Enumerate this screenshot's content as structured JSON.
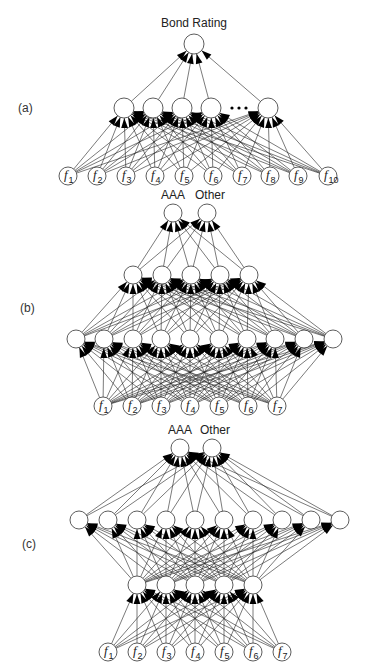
{
  "figure": {
    "panels": [
      {
        "id": "a",
        "label": "(a)",
        "label_pos": [
          18,
          112
        ],
        "output_labels": [
          "Bond Rating"
        ],
        "output_label_pos": [
          [
            194,
            27
          ]
        ],
        "layers": [
          {
            "name": "output",
            "y": 44,
            "r": 10,
            "x": [
              194
            ]
          },
          {
            "name": "hidden",
            "y": 108,
            "r": 10,
            "x": [
              124,
              153,
              182,
              211,
              268
            ],
            "ellipsis_x": [
              232,
              239,
              246
            ]
          },
          {
            "name": "input",
            "y": 176,
            "r": 9,
            "x": [
              68,
              97,
              126,
              155,
              184,
              213,
              242,
              270,
              298,
              328
            ],
            "labels": [
              "f1",
              "f2",
              "f3",
              "f4",
              "f5",
              "f6",
              "f7",
              "f8",
              "f9",
              "f10"
            ]
          }
        ]
      },
      {
        "id": "b",
        "label": "(b)",
        "label_pos": [
          20,
          312
        ],
        "output_labels": [
          "AAA",
          "Other"
        ],
        "output_label_pos": [
          [
            173,
            199
          ],
          [
            210,
            199
          ]
        ],
        "layers": [
          {
            "name": "output",
            "y": 213,
            "r": 9,
            "x": [
              173,
              207
            ]
          },
          {
            "name": "hidden-1",
            "y": 275,
            "r": 9,
            "x": [
              133,
              162,
              191,
              220,
              249
            ]
          },
          {
            "name": "hidden-2",
            "y": 339,
            "r": 9,
            "x": [
              76,
              104,
              133,
              161,
              190,
              219,
              247,
              275,
              304,
              333
            ]
          },
          {
            "name": "input",
            "y": 406,
            "r": 9,
            "x": [
              103,
              132,
              161,
              190,
              219,
              248,
              277
            ],
            "labels": [
              "f1",
              "f2",
              "f3",
              "f4",
              "f5",
              "f6",
              "f7"
            ]
          }
        ]
      },
      {
        "id": "c",
        "label": "(c)",
        "label_pos": [
          22,
          548
        ],
        "output_labels": [
          "AAA",
          "Other"
        ],
        "output_label_pos": [
          [
            180,
            434
          ],
          [
            215,
            434
          ]
        ],
        "layers": [
          {
            "name": "output",
            "y": 448,
            "r": 9,
            "x": [
              180,
              212
            ]
          },
          {
            "name": "hidden-1",
            "y": 520,
            "r": 9,
            "x": [
              79,
              108,
              137,
              166,
              195,
              224,
              253,
              282,
              311,
              340
            ]
          },
          {
            "name": "hidden-2",
            "y": 585,
            "r": 9,
            "x": [
              137,
              166,
              195,
              224,
              253
            ]
          },
          {
            "name": "input",
            "y": 652,
            "r": 9,
            "x": [
              108,
              137,
              166,
              195,
              224,
              253,
              282
            ],
            "labels": [
              "f1",
              "f2",
              "f3",
              "f4",
              "f5",
              "f6",
              "f7"
            ]
          }
        ]
      }
    ]
  }
}
